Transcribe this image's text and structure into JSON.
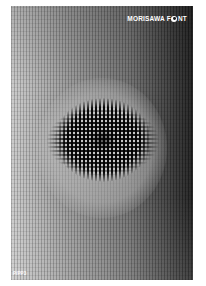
{
  "poster": {
    "brand_part1": "MORISAWA F",
    "brand_part2": "NT",
    "brand_full": "MORISAWA FONT",
    "code": "P/PP3",
    "colors": {
      "background": "#ffffff",
      "gradient_light": "#c9c9c9",
      "gradient_dark": "#1e1e1e",
      "text": "#ffffff"
    }
  }
}
